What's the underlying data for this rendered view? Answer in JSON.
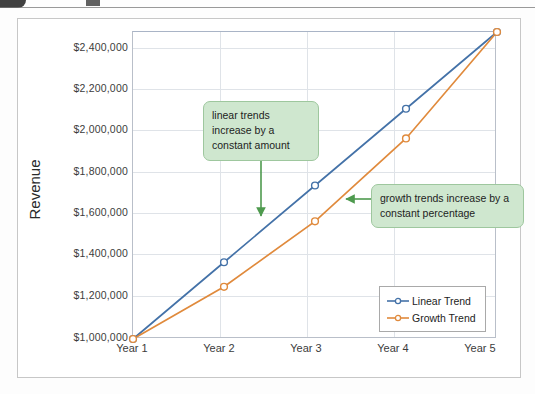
{
  "chart_data": {
    "type": "line",
    "title": "",
    "xlabel": "",
    "ylabel": "Revenue",
    "categories": [
      "Year 1",
      "Year 2",
      "Year 3",
      "Year 4",
      "Year 5"
    ],
    "series": [
      {
        "name": "Linear Trend",
        "color": "#4472a8",
        "values": [
          1000000,
          1375000,
          1750000,
          2125000,
          2500000
        ]
      },
      {
        "name": "Growth Trend",
        "color": "#e08a3c",
        "values": [
          1000000,
          1255000,
          1575000,
          1980000,
          2500000
        ]
      }
    ],
    "ylim": [
      1000000,
      2500000
    ],
    "yticks": [
      1000000,
      1200000,
      1400000,
      1600000,
      1800000,
      2000000,
      2200000,
      2400000
    ],
    "ytick_labels": [
      "$1,000,000",
      "$1,200,000",
      "$1,400,000",
      "$1,600,000",
      "$1,800,000",
      "$2,000,000",
      "$2,200,000",
      "$2,400,000"
    ],
    "grid": true,
    "legend_position": "inside-lower-right",
    "marker": "circle-open",
    "annotations": [
      {
        "id": "linear",
        "text": "linear trends increase by a constant amount",
        "arrow": "down",
        "color": "#4e9a4e"
      },
      {
        "id": "growth",
        "text": "growth trends increase by a constant percentage",
        "arrow": "left",
        "color": "#4e9a4e"
      }
    ]
  },
  "axis": {
    "y_title": "Revenue",
    "y_ticks": [
      "$2,400,000",
      "$2,200,000",
      "$2,000,000",
      "$1,800,000",
      "$1,600,000",
      "$1,400,000",
      "$1,200,000",
      "$1,000,000"
    ],
    "x_ticks": [
      "Year 1",
      "Year 2",
      "Year 3",
      "Year 4",
      "Year 5"
    ]
  },
  "legend": {
    "items": [
      {
        "label": "Linear Trend",
        "color": "#4472a8"
      },
      {
        "label": "Growth Trend",
        "color": "#e08a3c"
      }
    ]
  },
  "callouts": {
    "linear": "linear trends increase by a constant amount",
    "growth": "growth trends increase by a constant percentage"
  },
  "colors": {
    "linear_trend": "#4472a8",
    "growth_trend": "#e08a3c",
    "callout_fill": "#cfe7cf",
    "callout_border": "#9ec79e",
    "arrow": "#4e9a4e",
    "gridline": "#dfe3e8",
    "chart_border": "#c7c7c7"
  }
}
